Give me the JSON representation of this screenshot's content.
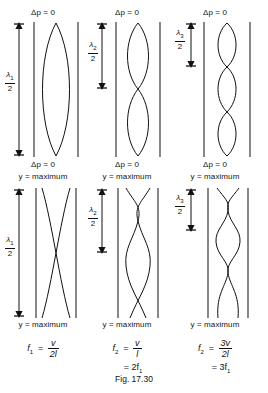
{
  "figure": {
    "caption": "Fig. 17.30",
    "columns": [
      {
        "id": "fundamental",
        "pressure_label_top": "Δp = 0",
        "pressure_label_bottom": "Δp = 0",
        "displacement_label_top": "y = maximum",
        "displacement_label_bottom": "y = maximum",
        "wavelength_symbol": "λ",
        "wavelength_subscript": "1",
        "wavelength_denominator": "2",
        "loops_pressure": 1,
        "loops_displacement": 1,
        "frequency_symbol": "f",
        "frequency_subscript": "1",
        "frequency_numerator": "v",
        "frequency_denominator": "2l",
        "frequency_relation": ""
      },
      {
        "id": "second-harmonic",
        "pressure_label_top": "Δp = 0",
        "pressure_label_bottom": "Δp = 0",
        "displacement_label_top": "y = maximum",
        "displacement_label_bottom": "y = maximum",
        "wavelength_symbol": "λ",
        "wavelength_subscript": "2",
        "wavelength_denominator": "2",
        "loops_pressure": 2,
        "loops_displacement": 2,
        "frequency_symbol": "f",
        "frequency_subscript": "2",
        "frequency_numerator": "v",
        "frequency_denominator": "l",
        "frequency_relation": "= 2f",
        "frequency_relation_subscript": "1"
      },
      {
        "id": "third-harmonic",
        "pressure_label_top": "Δp = 0",
        "pressure_label_bottom": "Δp = 0",
        "displacement_label_top": "y = maximum",
        "displacement_label_bottom": "y = maximum",
        "wavelength_symbol": "λ",
        "wavelength_subscript": "3",
        "wavelength_denominator": "2",
        "loops_pressure": 3,
        "loops_displacement": 3,
        "frequency_symbol": "f",
        "frequency_subscript": "2",
        "frequency_numerator": "3v",
        "frequency_denominator": "2l",
        "frequency_relation": "= 3f",
        "frequency_relation_subscript": "1"
      }
    ],
    "colors": {
      "ink": "#111111",
      "background": "#ffffff",
      "wall": "#555555"
    }
  }
}
